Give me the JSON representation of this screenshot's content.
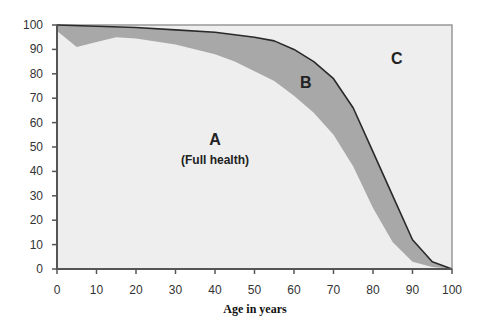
{
  "chart_data": {
    "type": "area",
    "title": "",
    "xlabel": "Age in years",
    "ylabel": "",
    "xlim": [
      0,
      100
    ],
    "ylim": [
      0,
      100
    ],
    "x_ticks": [
      0,
      10,
      20,
      30,
      40,
      50,
      60,
      70,
      80,
      90,
      100
    ],
    "y_ticks": [
      0,
      10,
      20,
      30,
      40,
      50,
      60,
      70,
      80,
      90,
      100
    ],
    "grid": false,
    "legend": null,
    "series": [
      {
        "name": "Survival (upper line)",
        "x": [
          0,
          10,
          20,
          30,
          40,
          45,
          50,
          55,
          60,
          65,
          70,
          75,
          80,
          85,
          90,
          95,
          100
        ],
        "values": [
          100,
          99.5,
          99,
          98,
          97,
          96,
          95,
          93.5,
          90,
          85,
          78,
          66,
          48,
          30,
          12,
          3,
          0
        ]
      },
      {
        "name": "Full health (lower boundary)",
        "x": [
          0,
          5,
          10,
          15,
          20,
          30,
          40,
          45,
          50,
          55,
          60,
          65,
          70,
          75,
          80,
          85,
          90,
          95,
          100
        ],
        "values": [
          97.5,
          91,
          93,
          95,
          94.5,
          92,
          88,
          85,
          81,
          77,
          71,
          64,
          55,
          42,
          25,
          11,
          3,
          0.8,
          0
        ]
      }
    ],
    "regions": [
      {
        "label": "A",
        "sublabel": "(Full health)",
        "x": 40,
        "y": 51
      },
      {
        "label": "B",
        "sublabel": "",
        "x": 63,
        "y": 74
      },
      {
        "label": "C",
        "sublabel": "",
        "x": 86,
        "y": 84
      }
    ],
    "colors": {
      "plot_background": "#eeeeee",
      "region_b_fill": "#a8a8a8",
      "upper_line": "#2a2a2a",
      "axis": "#555555"
    }
  }
}
